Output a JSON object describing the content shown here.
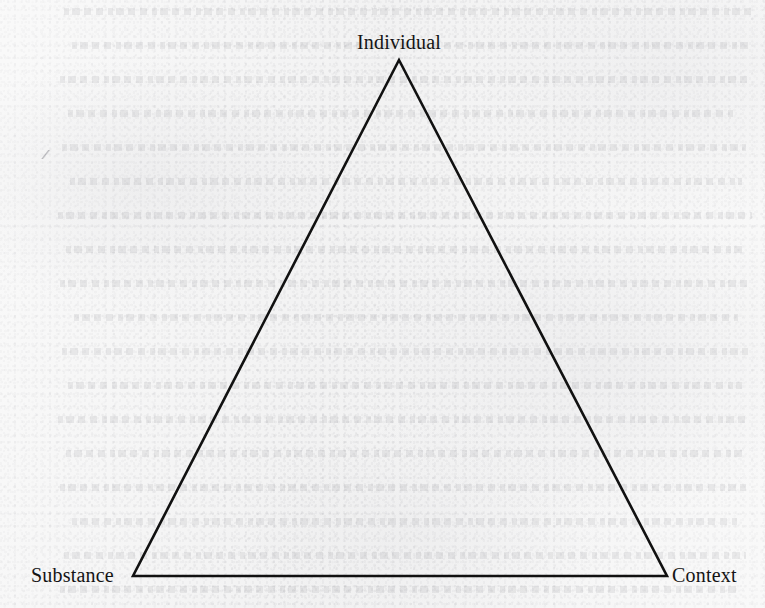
{
  "figure": {
    "type": "triangle-diagram",
    "background_color": "#f2f2f2",
    "stroke_color": "#111111",
    "text_color": "#141414",
    "vertices": [
      {
        "id": "apex",
        "label": "Individual",
        "x": 399,
        "y": 60,
        "label_position": "above"
      },
      {
        "id": "bottom-left",
        "label": "Substance",
        "x": 133,
        "y": 576,
        "label_position": "left"
      },
      {
        "id": "bottom-right",
        "label": "Context",
        "x": 667,
        "y": 576,
        "label_position": "right"
      }
    ],
    "edges": [
      {
        "from": "bottom-left",
        "to": "apex"
      },
      {
        "from": "apex",
        "to": "bottom-right"
      },
      {
        "from": "bottom-right",
        "to": "bottom-left"
      }
    ],
    "stroke_width": 2.6
  }
}
